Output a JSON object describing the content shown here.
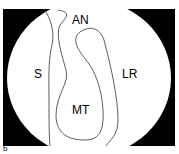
{
  "figure": {
    "panel_label": "b",
    "labels": {
      "an": "AN",
      "s": "S",
      "lr": "LR",
      "mt": "MT"
    },
    "colors": {
      "background": "#000000",
      "field": "#ffffff",
      "outline": "#333333"
    }
  }
}
